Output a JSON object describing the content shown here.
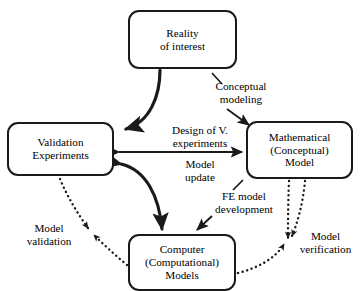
{
  "diagram": {
    "background": "#ffffff",
    "stroke_color": "#1a1a1a",
    "nodes": [
      {
        "id": "reality",
        "lines": [
          "Reality",
          "of interest"
        ]
      },
      {
        "id": "validation",
        "lines": [
          "Validation",
          "Experiments"
        ]
      },
      {
        "id": "math",
        "lines": [
          "Mathematical",
          "(Conceptual)",
          "Model"
        ]
      },
      {
        "id": "computer",
        "lines": [
          "Computer",
          "(Computational)",
          "Models"
        ]
      }
    ],
    "edge_labels": [
      {
        "id": "conceptual",
        "lines": [
          "Conceptual",
          "modeling"
        ]
      },
      {
        "id": "design",
        "lines": [
          "Design of V.",
          "experiments"
        ]
      },
      {
        "id": "model_update",
        "lines": [
          "Model",
          "update"
        ]
      },
      {
        "id": "fe",
        "lines": [
          "FE model",
          "development"
        ]
      },
      {
        "id": "validation_l",
        "lines": [
          "Model",
          "validation"
        ]
      },
      {
        "id": "verification",
        "lines": [
          "Model",
          "verification"
        ]
      }
    ]
  }
}
